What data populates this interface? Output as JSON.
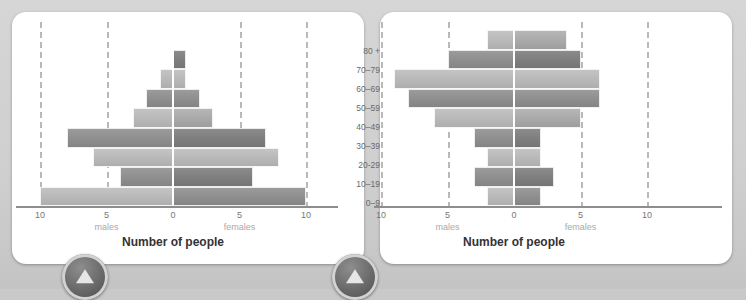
{
  "page": {
    "background_color": "#cfcfcf",
    "card_color": "#ffffff"
  },
  "age_labels": [
    "80 +",
    "70–79",
    "60–69",
    "50–59",
    "40–49",
    "30–39",
    "20-29",
    "10–19",
    "0–9"
  ],
  "axis": {
    "tick_labels": [
      "10",
      "5",
      "0",
      "5",
      "10"
    ],
    "tick_values": [
      -10,
      -5,
      0,
      5,
      10
    ],
    "males_label": "males",
    "females_label": "females",
    "title": "Number of people",
    "xlim": [
      -12,
      12
    ]
  },
  "badges": {
    "left_icon": "up-arrow-icon",
    "right_icon": "up-arrow-icon"
  },
  "chart_data": [
    {
      "type": "bar",
      "id": "population-pyramid-left",
      "title": "",
      "xlabel": "Number of people",
      "ylabel": "",
      "categories": [
        "80 +",
        "70–79",
        "60–69",
        "50–59",
        "40–49",
        "30–39",
        "20-29",
        "10–19",
        "0–9"
      ],
      "series": [
        {
          "name": "males",
          "values": [
            0,
            0,
            1,
            2,
            3,
            8,
            6,
            4,
            10
          ]
        },
        {
          "name": "females",
          "values": [
            0,
            1,
            1,
            2,
            3,
            7,
            8,
            6,
            10
          ]
        }
      ],
      "xlim": [
        -12,
        12
      ],
      "grid": true,
      "legend": "bottom-axis",
      "tick_labels": [
        "10",
        "5",
        "0",
        "5",
        "10"
      ]
    },
    {
      "type": "bar",
      "id": "population-pyramid-right",
      "title": "",
      "xlabel": "Number of people",
      "ylabel": "",
      "categories": [
        "80 +",
        "70–79",
        "60–69",
        "50–59",
        "40–49",
        "30–39",
        "20-29",
        "10–19",
        "0–9"
      ],
      "series": [
        {
          "name": "males",
          "values": [
            2,
            5,
            9,
            8,
            6,
            3,
            2,
            3,
            2
          ]
        },
        {
          "name": "females",
          "values": [
            4,
            5,
            6.5,
            6.5,
            5,
            2,
            2,
            3,
            2
          ]
        }
      ],
      "xlim": [
        -12,
        12
      ],
      "grid": true,
      "legend": "bottom-axis",
      "tick_labels": [
        "10",
        "5",
        "0",
        "5",
        "10"
      ]
    }
  ]
}
